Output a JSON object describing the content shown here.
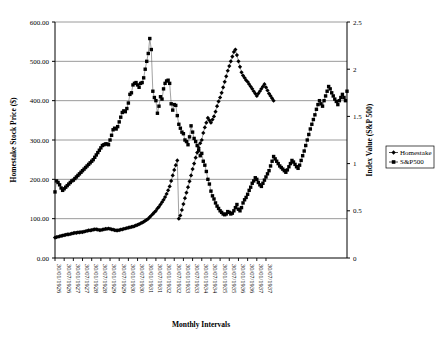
{
  "chart_data": {
    "type": "line",
    "title": "",
    "xlabel": "Monthly Intervals",
    "ylabel": "Homestake Stock Price ($)",
    "y2label": "Index Value (S&P 500)",
    "ylim": [
      0,
      600
    ],
    "y2lim": [
      0,
      2.5
    ],
    "grid": true,
    "legend_position": "right",
    "y_ticks": [
      "0.00",
      "100.00",
      "200.00",
      "300.00",
      "400.00",
      "500.00",
      "600.00"
    ],
    "y2_ticks": [
      "0",
      "0.5",
      "1",
      "1.5",
      "2",
      "2.5"
    ],
    "x_ticks": [
      "30/01/1926",
      "30/07/1926",
      "30/01/1927",
      "30/07/1927",
      "30/01/1928",
      "30/07/1928",
      "30/01/1929",
      "30/07/1929",
      "30/01/1930",
      "30/07/1930",
      "30/01/1931",
      "30/07/1931",
      "30/01/1932",
      "30/07/1932",
      "30/01/1933",
      "30/07/1933",
      "30/01/1934",
      "30/07/1934",
      "30/01/1935",
      "30/07/1935",
      "30/01/1936",
      "30/07/1936",
      "30/01/1937",
      "30/07/1937"
    ],
    "x_start": "30/01/1926",
    "x_end": "30/12/1937",
    "series": [
      {
        "name": "Homestake",
        "marker": "diamond",
        "color": "#000000",
        "axis": "left",
        "values": [
          52,
          53,
          54,
          55,
          56,
          57,
          58,
          59,
          60,
          60,
          61,
          62,
          63,
          64,
          64,
          65,
          65,
          66,
          66,
          67,
          68,
          69,
          70,
          70,
          71,
          72,
          73,
          73,
          72,
          71,
          71,
          72,
          73,
          74,
          74,
          75,
          74,
          73,
          72,
          71,
          70,
          70,
          71,
          72,
          73,
          74,
          75,
          76,
          77,
          78,
          79,
          80,
          81,
          83,
          84,
          86,
          88,
          90,
          92,
          95,
          97,
          100,
          104,
          108,
          112,
          116,
          120,
          126,
          130,
          136,
          142,
          148,
          155,
          163,
          172,
          182,
          196,
          210,
          224,
          236,
          248,
          100,
          108,
          122,
          137,
          152,
          166,
          180,
          195,
          210,
          226,
          240,
          255,
          268,
          280,
          292,
          300,
          318,
          332,
          344,
          356,
          350,
          344,
          352,
          360,
          372,
          386,
          398,
          408,
          420,
          434,
          448,
          462,
          476,
          488,
          500,
          512,
          524,
          530,
          516,
          500,
          486,
          472,
          464,
          458,
          452,
          448,
          442,
          436,
          430,
          424,
          418,
          412,
          418,
          424,
          430,
          436,
          442,
          434,
          426,
          418,
          412,
          406,
          400
        ]
      },
      {
        "name": "S&P500",
        "marker": "square",
        "color": "#000000",
        "axis": "left",
        "values": [
          168,
          196,
          192,
          186,
          178,
          172,
          176,
          180,
          184,
          188,
          192,
          196,
          198,
          202,
          206,
          210,
          214,
          218,
          222,
          226,
          230,
          234,
          238,
          242,
          246,
          250,
          256,
          262,
          268,
          274,
          280,
          286,
          288,
          290,
          290,
          288,
          300,
          312,
          326,
          330,
          328,
          334,
          346,
          358,
          370,
          374,
          372,
          380,
          394,
          416,
          420,
          440,
          444,
          446,
          440,
          434,
          444,
          446,
          458,
          480,
          500,
          520,
          558,
          530,
          424,
          408,
          400,
          368,
          386,
          410,
          404,
          430,
          444,
          450,
          452,
          444,
          392,
          376,
          390,
          388,
          362,
          340,
          330,
          320,
          316,
          300,
          296,
          288,
          308,
          336,
          320,
          304,
          296,
          286,
          274,
          260,
          266,
          246,
          236,
          220,
          200,
          188,
          170,
          158,
          150,
          140,
          132,
          126,
          120,
          116,
          112,
          110,
          112,
          118,
          116,
          112,
          114,
          120,
          128,
          136,
          124,
          120,
          128,
          140,
          148,
          154,
          162,
          172,
          180,
          190,
          196,
          204,
          200,
          192,
          186,
          182,
          190,
          198,
          206,
          214,
          222,
          234,
          246,
          258,
          252,
          246,
          240,
          234,
          230,
          226,
          222,
          218,
          224,
          232,
          240,
          248,
          244,
          238,
          232,
          228,
          236,
          248,
          260,
          272,
          286,
          300,
          314,
          328,
          340,
          352,
          364,
          378,
          390,
          400,
          392,
          386,
          400,
          412,
          424,
          436,
          430,
          420,
          412,
          404,
          398,
          390,
          400,
          408,
          416,
          408,
          400,
          424
        ]
      }
    ]
  },
  "legend": {
    "items": [
      {
        "label": "Homestake",
        "marker": "diamond"
      },
      {
        "label": "S&P500",
        "marker": "square"
      }
    ]
  }
}
